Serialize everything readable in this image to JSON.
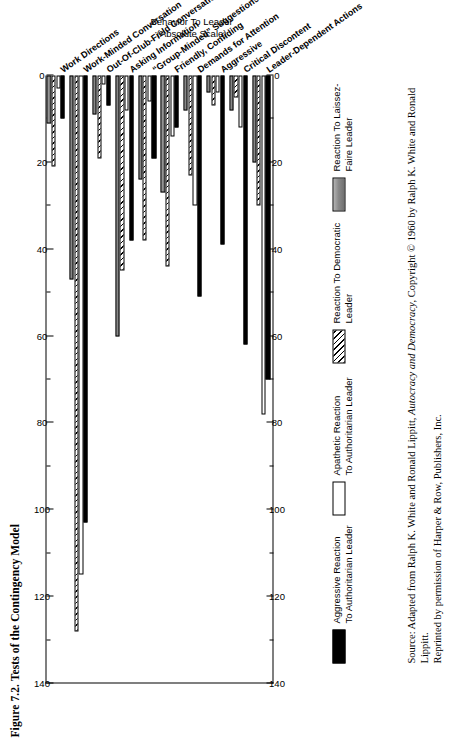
{
  "figure": {
    "title": "Figure 7.2. Tests of the Contingency Model"
  },
  "axis": {
    "value_axis_title_line1": "Behavior To Leader",
    "value_axis_title_line2": "(Absolute Scale)",
    "tick_labels": [
      "140",
      "120",
      "100",
      "80",
      "60",
      "40",
      "20",
      "0"
    ],
    "min": 0,
    "max": 140,
    "major_step": 20,
    "minor_step": 10,
    "direction": "right-to-left"
  },
  "legend": {
    "items": [
      {
        "swatch": "black",
        "line1": "Aggressive Reaction",
        "line2": "To Authoritarian Leader"
      },
      {
        "swatch": "white",
        "line1": "Apathetic Reaction",
        "line2": "To Authoritarian Leader"
      },
      {
        "swatch": "hatch",
        "line1": "Reaction To Democratic",
        "line2": "Leader"
      },
      {
        "swatch": "gray",
        "line1": "Reaction To Laissez-",
        "line2": "Faire Leader"
      }
    ]
  },
  "source": {
    "prefix": "Source:",
    "part1": " Adapted from Ralph K. White and Ronald Lippitt, ",
    "italic": "Autocracy and Democracy",
    "part2": ", Copyright © 1960 by Ralph K. White and Ronald Lippitt.",
    "line2": "Reprinted by permission of Harper & Row, Publishers, Inc."
  },
  "chart_data": {
    "type": "bar",
    "title": "Figure 7.2. Tests of the Contingency Model",
    "xlabel": "",
    "ylabel": "Behavior To Leader (Absolute Scale)",
    "ylim": [
      0,
      140
    ],
    "grid": false,
    "orientation": "horizontal",
    "legend_position": "below",
    "categories": [
      "Work Directions",
      "Work-Minded Conversation",
      "Out-Of-Club-Field Conversation",
      "Asking Information",
      "“Group-Minded” Suggestions",
      "Friendly, Confiding",
      "Demands for Attention",
      "Aggressive",
      "Critical Discontent",
      "Leader-Dependent Actions"
    ],
    "series": [
      {
        "name": "Aggressive Reaction To Authoritarian Leader",
        "swatch": "black",
        "values": [
          10,
          103,
          7,
          38,
          19,
          12,
          51,
          39,
          62,
          70
        ]
      },
      {
        "name": "Apathetic Reaction To Authoritarian Leader",
        "swatch": "white",
        "values": [
          3,
          115,
          2,
          8,
          6,
          14,
          30,
          4,
          12,
          78
        ]
      },
      {
        "name": "Reaction To Democratic Leader",
        "swatch": "hatch",
        "values": [
          21,
          128,
          19,
          45,
          38,
          44,
          23,
          7,
          5,
          30
        ]
      },
      {
        "name": "Reaction To Laissez-Faire Leader",
        "swatch": "gray",
        "values": [
          11,
          47,
          9,
          60,
          24,
          27,
          8,
          4,
          8,
          20
        ]
      }
    ]
  }
}
